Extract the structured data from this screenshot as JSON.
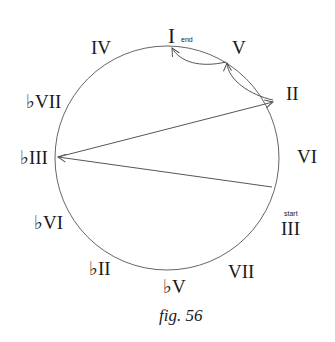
{
  "figure": {
    "caption": "fig. 56",
    "stroke_color": "#555555",
    "labels": {
      "I": "I",
      "V": "V",
      "II": "II",
      "VI": "VI",
      "III": "III",
      "VII": "VII",
      "flatV": "♭V",
      "flatII": "♭II",
      "flatVI": "♭VI",
      "flatIII": "♭III",
      "flatVII": "♭VII",
      "IV": "IV"
    },
    "annotations": {
      "end": "end",
      "start": "start"
    },
    "progression": [
      "III",
      "♭III",
      "II",
      "V",
      "I"
    ]
  }
}
